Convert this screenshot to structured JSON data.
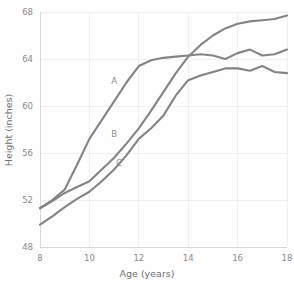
{
  "chart_data": {
    "type": "line",
    "title": "",
    "xlabel": "Age (years)",
    "ylabel": "Height (inches)",
    "xlim": [
      8,
      18
    ],
    "ylim": [
      48,
      68
    ],
    "xticks": [
      8,
      10,
      12,
      14,
      16,
      18
    ],
    "yticks": [
      48,
      52,
      56,
      60,
      64,
      68
    ],
    "xtick_labels": [
      "8",
      "10",
      "12",
      "14",
      "16",
      "18"
    ],
    "ytick_labels": [
      "48",
      "52",
      "56",
      "60",
      "64",
      "68"
    ],
    "grid": true,
    "legend": "inline-annotations",
    "line_color": "#848484",
    "background_color": "#fefefe",
    "grid_color": "#f0f0f2",
    "axis_color": "#d9d9dd",
    "tick_label_color": "#8a8a8a",
    "axis_title_color": "#6f6f6f",
    "x": [
      8,
      8.5,
      9,
      9.5,
      10,
      10.5,
      11,
      11.5,
      12,
      12.5,
      13,
      13.5,
      14,
      14.5,
      15,
      15.5,
      16,
      16.5,
      17,
      17.5,
      18
    ],
    "series": [
      {
        "name": "A",
        "label": "A",
        "label_x": 11.0,
        "label_y": 61.9,
        "values": [
          51.3,
          52.0,
          52.9,
          55.0,
          57.2,
          58.8,
          60.4,
          62.0,
          63.4,
          63.9,
          64.1,
          64.2,
          64.3,
          64.4,
          64.3,
          64.0,
          64.5,
          64.8,
          64.3,
          64.4,
          64.8
        ]
      },
      {
        "name": "B",
        "label": "B",
        "label_x": 11.0,
        "label_y": 57.4,
        "values": [
          51.3,
          51.9,
          52.6,
          53.1,
          53.6,
          54.6,
          55.6,
          56.8,
          58.1,
          59.6,
          61.2,
          62.8,
          64.2,
          65.2,
          66.0,
          66.6,
          67.0,
          67.2,
          67.3,
          67.4,
          67.7
        ]
      },
      {
        "name": "C",
        "label": "C",
        "label_x": 11.2,
        "label_y": 54.9,
        "values": [
          49.9,
          50.6,
          51.4,
          52.1,
          52.7,
          53.6,
          54.6,
          55.8,
          57.2,
          58.1,
          59.2,
          60.9,
          62.2,
          62.6,
          62.9,
          63.2,
          63.2,
          63.0,
          63.4,
          62.9,
          62.8
        ]
      }
    ]
  }
}
